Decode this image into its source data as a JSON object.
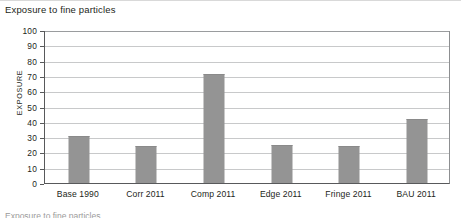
{
  "figure": {
    "title": "Exposure to fine particles",
    "caption_partial": "Exposure to fine particles"
  },
  "colors": {
    "bar": "#949494",
    "axis": "#58595b",
    "gridline": "#c8c9ca",
    "text": "#231f20",
    "background": "#ffffff"
  },
  "chart_data": {
    "type": "bar",
    "title": "Exposure to fine particles",
    "xlabel": "",
    "ylabel": "EXPOSURE",
    "categories": [
      "Base 1990",
      "Corr 2011",
      "Comp 2011",
      "Edge 2011",
      "Fringe 2011",
      "BAU 2011"
    ],
    "values": [
      31,
      24,
      71,
      25,
      24,
      42
    ],
    "ylim": [
      0,
      100
    ],
    "ytick_step": 10,
    "yticks": [
      100,
      90,
      80,
      70,
      60,
      50,
      40,
      30,
      20,
      10,
      0
    ],
    "grid": true,
    "legend": "none",
    "series": [
      {
        "name": "Exposure",
        "values": [
          31,
          24,
          71,
          25,
          24,
          42
        ]
      }
    ]
  }
}
